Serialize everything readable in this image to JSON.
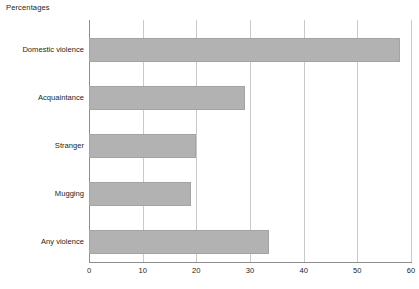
{
  "chart_data": {
    "type": "bar",
    "orientation": "horizontal",
    "title": "Percentages",
    "xlabel": "",
    "ylabel": "",
    "xlim": [
      0,
      60
    ],
    "ylim": null,
    "grid": true,
    "legend": null,
    "xticks": [
      "0",
      "10",
      "20",
      "30",
      "40",
      "50",
      "60"
    ],
    "xtick_values": [
      0,
      10,
      20,
      30,
      40,
      50,
      60
    ],
    "categories": [
      "Domestic violence",
      "Acquaintance",
      "Stranger",
      "Mugging",
      "Any violence"
    ],
    "values": [
      58,
      29,
      20,
      19,
      33.5
    ],
    "bar_color": "#b2b2b2",
    "bar_border_color": "#a3a3a3",
    "grid_color": "#c9c9c9",
    "axis_color": "#8d8d8d",
    "text_color": "#231f20"
  }
}
